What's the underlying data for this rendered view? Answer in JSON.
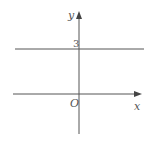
{
  "diagram": {
    "x_axis_label": "x",
    "y_axis_label": "y",
    "origin_label": "O",
    "line_intercept_label": "3",
    "line_equation": "y = 3",
    "colors": {
      "axis": "#555555",
      "line": "#555555"
    }
  }
}
